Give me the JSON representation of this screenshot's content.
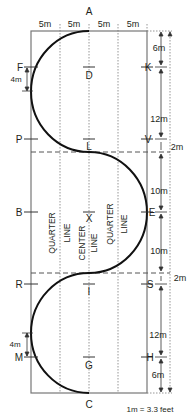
{
  "diagram": {
    "arena": {
      "width_m": 20,
      "length_m": 60
    },
    "colors": {
      "line": "#231f20",
      "background": "#ffffff",
      "dotted": "#8a8a8a"
    },
    "top_widths": [
      "5m",
      "5m",
      "5m",
      "5m"
    ],
    "letters": {
      "A": "A",
      "C": "C",
      "F": "F",
      "K": "K",
      "P": "P",
      "V": "V",
      "B": "B",
      "E": "E",
      "R": "R",
      "S": "S",
      "M": "M",
      "H": "H",
      "D": "D",
      "L": "L",
      "X": "X",
      "I": "I",
      "G": "G"
    },
    "right_dimensions": [
      "6m",
      "12m",
      "2m",
      "10m",
      "10m",
      "2m",
      "12m",
      "6m"
    ],
    "left_dimensions": [
      "4m",
      "4m"
    ],
    "line_labels": {
      "quarter_left": [
        "QUARTER",
        "LINE"
      ],
      "center": [
        "CENTER",
        "LINE"
      ],
      "quarter_right": [
        "QUARTER",
        "LINE"
      ]
    },
    "scale_note": "1m = 3.3 feet"
  }
}
